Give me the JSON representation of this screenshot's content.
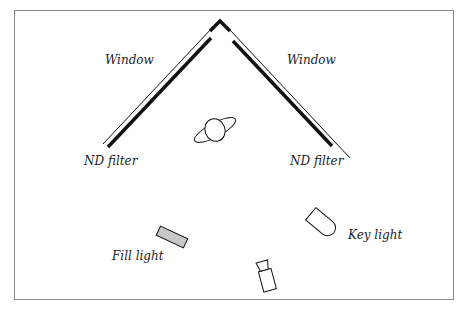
{
  "diagram": {
    "type": "lighting-setup-floor-plan",
    "labels": {
      "window_left": "Window",
      "window_right": "Window",
      "nd_filter_left": "ND filter",
      "nd_filter_right": "ND filter",
      "fill_light": "Fill light",
      "key_light": "Key light"
    },
    "elements": [
      {
        "id": "window-left",
        "kind": "window",
        "label": "Window"
      },
      {
        "id": "window-right",
        "kind": "window",
        "label": "Window"
      },
      {
        "id": "nd-filter-left",
        "kind": "nd-filter",
        "label": "ND filter"
      },
      {
        "id": "nd-filter-right",
        "kind": "nd-filter",
        "label": "ND filter"
      },
      {
        "id": "subject",
        "kind": "subject",
        "label": ""
      },
      {
        "id": "fill-light",
        "kind": "light",
        "label": "Fill light",
        "fill": "#c8c8c8"
      },
      {
        "id": "key-light",
        "kind": "light",
        "label": "Key light"
      },
      {
        "id": "camera",
        "kind": "camera",
        "label": ""
      }
    ],
    "colors": {
      "frame": "#8a8a8a",
      "stroke": "#111111",
      "fill_light_fill": "#c8c8c8",
      "background": "#ffffff"
    }
  }
}
